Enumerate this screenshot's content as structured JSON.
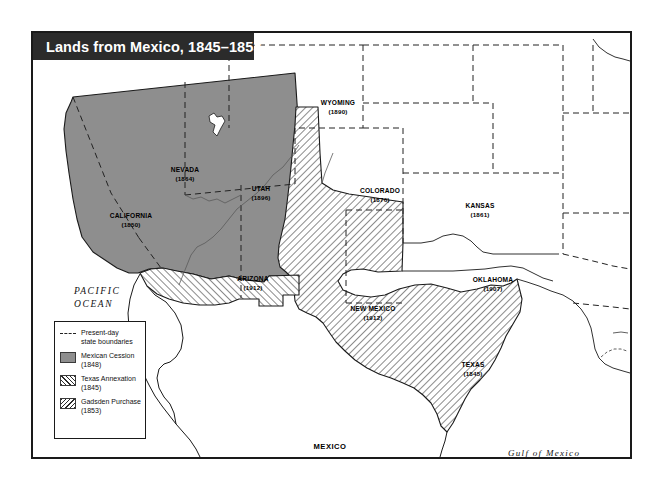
{
  "title": {
    "text": "Lands from Mexico, 1845–1853"
  },
  "legend": {
    "items": [
      {
        "label": "Present-day\nstate boundaries",
        "swatch": "dashed-line"
      },
      {
        "label": "Mexican Cession\n(1848)",
        "swatch": "solid-gray"
      },
      {
        "label": "Texas Annexation\n(1845)",
        "swatch": "hatch-forward"
      },
      {
        "label": "Gadsden Purchase\n(1853)",
        "swatch": "hatch-backward"
      }
    ]
  },
  "states": [
    {
      "name": "CALIFORNIA",
      "year": "(1850)",
      "x": 98,
      "y": 179
    },
    {
      "name": "NEVADA",
      "year": "(1864)",
      "x": 152,
      "y": 133
    },
    {
      "name": "UTAH",
      "year": "(1896)",
      "x": 228,
      "y": 152
    },
    {
      "name": "ARIZONA",
      "year": "(1912)",
      "x": 220,
      "y": 242
    },
    {
      "name": "WYOMING",
      "year": "(1890)",
      "x": 305,
      "y": 66
    },
    {
      "name": "COLORADO",
      "year": "(1876)",
      "x": 347,
      "y": 154
    },
    {
      "name": "KANSAS",
      "year": "(1861)",
      "x": 447,
      "y": 169
    },
    {
      "name": "NEW MEXICO",
      "year": "(1912)",
      "x": 340,
      "y": 272
    },
    {
      "name": "OKLAHOMA",
      "year": "(1907)",
      "x": 460,
      "y": 243
    },
    {
      "name": "TEXAS",
      "year": "(1845)",
      "x": 440,
      "y": 328
    }
  ],
  "countries": [
    {
      "name": "MEXICO",
      "x": 297,
      "y": 409
    }
  ],
  "water": [
    {
      "name": "PACIFIC\nOCEAN",
      "x": 70,
      "y": 259
    },
    {
      "name": "Gulf of Mexico",
      "x": 540,
      "y": 421
    }
  ],
  "colors": {
    "cession_fill": "#8e8e8e",
    "hatch_stroke": "#2b2b2b",
    "outline": "#1a1a1a",
    "banner_bg": "#2b2b2b",
    "banner_text": "#ffffff",
    "page_bg": "#ffffff"
  }
}
